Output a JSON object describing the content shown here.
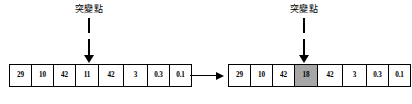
{
  "diagram": {
    "mutation_label": "突變點",
    "highlight_color": "#a6a6a6",
    "stroke_color": "#000000",
    "background_color": "#ffffff",
    "transition_arrow": "right-arrow",
    "pointer_icon": "down-arrow"
  },
  "before": {
    "name": "original chromosome",
    "mutation_index": 3,
    "genes": [
      {
        "value": "29",
        "highlighted": false,
        "width": 22
      },
      {
        "value": "10",
        "highlighted": false,
        "width": 22
      },
      {
        "value": "42",
        "highlighted": false,
        "width": 22
      },
      {
        "value": "11",
        "highlighted": false,
        "width": 23
      },
      {
        "value": "42",
        "highlighted": false,
        "width": 25
      },
      {
        "value": "3",
        "highlighted": false,
        "width": 24
      },
      {
        "value": "0.3",
        "highlighted": false,
        "width": 22
      },
      {
        "value": "0.1",
        "highlighted": false,
        "width": 21
      }
    ]
  },
  "after": {
    "name": "mutated chromosome",
    "mutation_index": 3,
    "genes": [
      {
        "value": "29",
        "highlighted": false,
        "width": 22
      },
      {
        "value": "10",
        "highlighted": false,
        "width": 22
      },
      {
        "value": "42",
        "highlighted": false,
        "width": 22
      },
      {
        "value": "18",
        "highlighted": true,
        "width": 23
      },
      {
        "value": "42",
        "highlighted": false,
        "width": 25
      },
      {
        "value": "3",
        "highlighted": false,
        "width": 24
      },
      {
        "value": "0.3",
        "highlighted": false,
        "width": 22
      },
      {
        "value": "0.1",
        "highlighted": false,
        "width": 21
      }
    ]
  }
}
